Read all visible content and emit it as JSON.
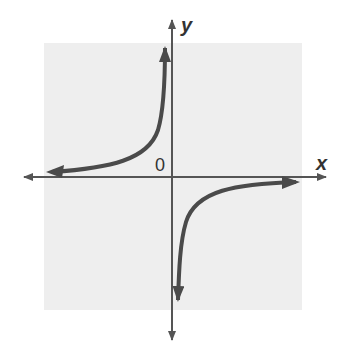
{
  "figure": {
    "x_axis_label": "x",
    "y_axis_label": "y",
    "origin_label": "0",
    "colors": {
      "background": "#ffffff",
      "grid_area": "#eeeeee",
      "axis": "#555555",
      "curve": "#4a4a4a"
    }
  }
}
